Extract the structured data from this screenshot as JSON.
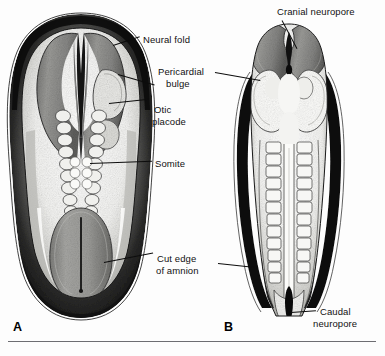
{
  "figure": {
    "type": "anatomical-illustration",
    "style": "black-and-white stipple engraving with gray tones",
    "panels": [
      {
        "letter": "A",
        "description": "Embryo with open neural folds, somites flanking the neural groove, surrounded by cut amnion"
      },
      {
        "letter": "B",
        "description": "Older embryo with largely closed neural tube, paired somite columns, cranial and caudal neuropores open"
      }
    ]
  },
  "labels": {
    "neural_fold": "Neural fold",
    "pericardial_line1": "Pericardial",
    "pericardial_line2": "bulge",
    "otic_line1": "Otic",
    "otic_line2": "placode",
    "somite": "Somite",
    "cut_edge_line1": "Cut edge",
    "cut_edge_line2": "of amnion",
    "cranial_neuropore": "Cranial neuropore",
    "caudal_line1": "Caudal",
    "caudal_line2": "neuropore"
  },
  "panel_letters": {
    "a": "A",
    "b": "B"
  },
  "colors": {
    "ink": "#0d0d0d",
    "label_text": "#111111",
    "neural_fold_gray": "#8a8a8a",
    "fold_gray_dark": "#6e6e6e",
    "tissue_light": "#f2f2f0",
    "tissue_mid": "#cfcfcb",
    "amnion_dark": "#141414",
    "rule": "#6d6d72",
    "background": "#fdfdfd"
  }
}
